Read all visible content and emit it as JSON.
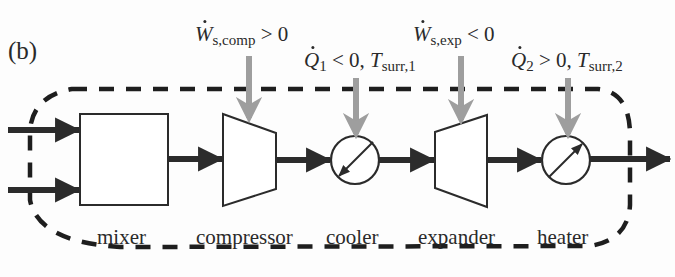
{
  "figure": {
    "panel_label": "(b)",
    "colors": {
      "stream": "#2b2b2b",
      "energy_arrow": "#9e9e9e",
      "boundary": "#1e1e1e",
      "background": "#fdfdfd"
    }
  },
  "units": [
    {
      "id": "mixer",
      "label": "mixer",
      "shape": "rectangle"
    },
    {
      "id": "compressor",
      "label": "compressor",
      "shape": "trapezoid-converging"
    },
    {
      "id": "cooler",
      "label": "cooler",
      "shape": "heat-exchanger-circle",
      "arrow": "down-left"
    },
    {
      "id": "expander",
      "label": "expander",
      "shape": "trapezoid-diverging"
    },
    {
      "id": "heater",
      "label": "heater",
      "shape": "heat-exchanger-circle",
      "arrow": "up-right"
    }
  ],
  "energy_flows": [
    {
      "target": "compressor",
      "symbol": "W",
      "subscript": "s,comp",
      "relation": "> 0",
      "temperature": null
    },
    {
      "target": "cooler",
      "symbol": "Q",
      "subscript": "1",
      "relation": "< 0",
      "temperature": {
        "symbol": "T",
        "subscript": "surr,1"
      }
    },
    {
      "target": "expander",
      "symbol": "W",
      "subscript": "s,exp",
      "relation": "< 0",
      "temperature": null
    },
    {
      "target": "heater",
      "symbol": "Q",
      "subscript": "2",
      "relation": "> 0",
      "temperature": {
        "symbol": "T",
        "subscript": "surr,2"
      }
    }
  ],
  "streams": {
    "inlets": 2,
    "outlets": 1,
    "sequence": [
      "inlet-1",
      "inlet-2",
      "mixer",
      "compressor",
      "cooler",
      "expander",
      "heater",
      "outlet"
    ]
  },
  "boundary": {
    "style": "dashed",
    "encloses": [
      "mixer",
      "compressor",
      "cooler",
      "expander",
      "heater"
    ]
  }
}
